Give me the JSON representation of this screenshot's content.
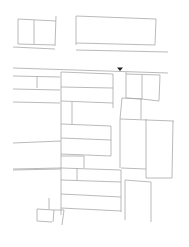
{
  "map": {
    "width": 189,
    "height": 247,
    "line_color": "#a8a8a8",
    "marker_color": "#222222",
    "marker": {
      "icon": "location-arrow-icon",
      "x": 120,
      "y": 69
    },
    "segments": [
      [
        18,
        19,
        56,
        21
      ],
      [
        18,
        19,
        18,
        44
      ],
      [
        34,
        20,
        34,
        44
      ],
      [
        56,
        16,
        55,
        46
      ],
      [
        18,
        44,
        55,
        45
      ],
      [
        13,
        47,
        55,
        49
      ],
      [
        76,
        16,
        156,
        19
      ],
      [
        76,
        16,
        76,
        45
      ],
      [
        156,
        19,
        155,
        45
      ],
      [
        76,
        43,
        155,
        45
      ],
      [
        76,
        50,
        168,
        52
      ],
      [
        13,
        68,
        168,
        73
      ],
      [
        13,
        76,
        60,
        77
      ],
      [
        37,
        76,
        37,
        88
      ],
      [
        13,
        89,
        60,
        90
      ],
      [
        13,
        102,
        60,
        103
      ],
      [
        61,
        72,
        61,
        215
      ],
      [
        61,
        72,
        113,
        74
      ],
      [
        113,
        74,
        113,
        108
      ],
      [
        61,
        87,
        113,
        88
      ],
      [
        61,
        101,
        113,
        103
      ],
      [
        72,
        102,
        72,
        125
      ],
      [
        61,
        124,
        111,
        126
      ],
      [
        111,
        126,
        111,
        156
      ],
      [
        61,
        138,
        111,
        140
      ],
      [
        61,
        154,
        111,
        156
      ],
      [
        61,
        156,
        84,
        156
      ],
      [
        84,
        156,
        84,
        168
      ],
      [
        61,
        168,
        121,
        170
      ],
      [
        77,
        168,
        77,
        180
      ],
      [
        13,
        169,
        61,
        168
      ],
      [
        61,
        180,
        121,
        182
      ],
      [
        61,
        194,
        121,
        197
      ],
      [
        61,
        208,
        121,
        211
      ],
      [
        121,
        170,
        121,
        212
      ],
      [
        126,
        72,
        126,
        98
      ],
      [
        126,
        74,
        160,
        75
      ],
      [
        142,
        75,
        142,
        99
      ],
      [
        160,
        75,
        159,
        101
      ],
      [
        126,
        98,
        142,
        99
      ],
      [
        142,
        99,
        159,
        101
      ],
      [
        122,
        98,
        120,
        119
      ],
      [
        122,
        98,
        142,
        99
      ],
      [
        141,
        99,
        141,
        119
      ],
      [
        120,
        119,
        174,
        121
      ],
      [
        120,
        119,
        120,
        168
      ],
      [
        146,
        119,
        146,
        178
      ],
      [
        173,
        121,
        172,
        178
      ],
      [
        146,
        178,
        172,
        178
      ],
      [
        121,
        168,
        146,
        169
      ],
      [
        13,
        143,
        61,
        141
      ],
      [
        13,
        170,
        61,
        169
      ],
      [
        125,
        180,
        125,
        220
      ],
      [
        125,
        180,
        151,
        182
      ],
      [
        151,
        182,
        151,
        222
      ],
      [
        37,
        209,
        54,
        210
      ],
      [
        37,
        209,
        37,
        221
      ],
      [
        37,
        221,
        52,
        222
      ],
      [
        54,
        210,
        53,
        222
      ],
      [
        49,
        198,
        49,
        209
      ],
      [
        54,
        210,
        64,
        210
      ],
      [
        64,
        210,
        62,
        225
      ]
    ]
  }
}
